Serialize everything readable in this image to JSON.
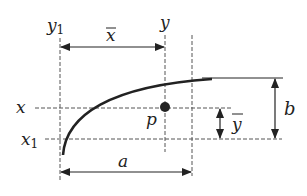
{
  "figure": {
    "labels": {
      "y1": "y",
      "y1_sub": "1",
      "y": "y",
      "xbar": "x",
      "x": "x",
      "x1": "x",
      "x1_sub": "1",
      "p": "p",
      "ybar": "y",
      "a": "a",
      "b": "b"
    },
    "colors": {
      "stroke": "#222222",
      "dash": "#555555",
      "background": "#ffffff"
    }
  }
}
